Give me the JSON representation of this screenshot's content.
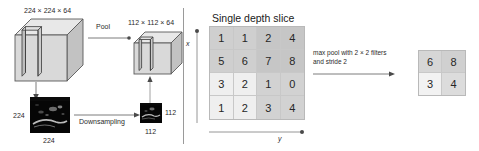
{
  "figure": {
    "left_panel": {
      "volume_in_label": "224 × 224 × 64",
      "volume_out_label": "112 × 112 × 64",
      "pool_arrow_label": "Pool",
      "downsampling_arrow_label": "Downsampling",
      "image_in_side_label": "224",
      "image_in_bottom_label": "224",
      "image_out_side_label": "112",
      "image_out_bottom_label": "112"
    },
    "right_panel": {
      "title": "Single depth slice",
      "x_axis_label": "x",
      "y_axis_label": "y",
      "operation_label_line1": "max pool with 2 × 2 filters",
      "operation_label_line2": "and stride 2",
      "input_matrix": [
        [
          1,
          1,
          2,
          4
        ],
        [
          5,
          6,
          7,
          8
        ],
        [
          3,
          2,
          1,
          0
        ],
        [
          1,
          2,
          3,
          4
        ]
      ],
      "output_matrix": [
        [
          6,
          8
        ],
        [
          3,
          4
        ]
      ]
    },
    "icons": {
      "cube_large": "cube-3d-icon",
      "cube_small": "cube-3d-icon",
      "feature_map_large": "feature-map-thumbnail-icon",
      "feature_map_small": "feature-map-thumbnail-icon",
      "pool_arrow": "arrow-right-icon",
      "downsampling_arrow": "arrow-right-icon",
      "maxpool_arrow": "arrow-right-icon",
      "volume_down_arrow": "arrow-down-icon",
      "volume_up_arrow": "arrow-up-icon",
      "x_axis_arrow": "arrow-up-icon",
      "y_axis_arrow": "arrow-right-icon",
      "divider": "vertical-divider"
    },
    "colors": {
      "cube_face_front": "#d8d8d8",
      "cube_face_top": "#e6e6e6",
      "cube_face_side": "#c4c4c4",
      "cube_stroke": "#5a5a5a",
      "grid_quadrant_tl": "#cfcfcf",
      "grid_quadrant_tr": "#c6c6c6",
      "grid_quadrant_bl": "#efefef",
      "grid_quadrant_br": "#d2d2d2",
      "line": "#6e6e6e",
      "text": "#262626",
      "thumbnail_bg": "#050505"
    }
  }
}
